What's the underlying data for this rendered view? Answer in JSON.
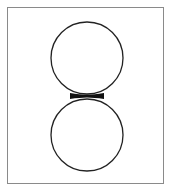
{
  "diagram": {
    "frame": {
      "x": 7,
      "y": 7,
      "width": 157,
      "height": 177,
      "stroke": "#8a8a8a"
    },
    "shapes": [
      {
        "type": "circle",
        "name": "top-circle",
        "cx": 87,
        "cy": 58,
        "r": 36,
        "stroke": "#222222"
      },
      {
        "type": "circle",
        "name": "bottom-circle",
        "cx": 87,
        "cy": 135,
        "r": 36,
        "stroke": "#222222"
      },
      {
        "type": "neck",
        "name": "junction-neck",
        "x": 74,
        "y": 94,
        "width": 26,
        "height": 5,
        "fill": "#111111"
      }
    ]
  }
}
